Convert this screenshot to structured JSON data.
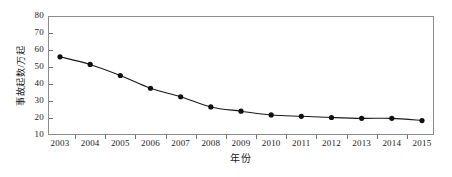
{
  "chart_data": {
    "type": "line",
    "title": "",
    "subtitle": "",
    "xlabel": "年份",
    "ylabel": "事故起数/万起",
    "categories": [
      "2003",
      "2004",
      "2005",
      "2006",
      "2007",
      "2008",
      "2009",
      "2010",
      "2011",
      "2012",
      "2013",
      "2014",
      "2015"
    ],
    "values": [
      56,
      51.5,
      45,
      37.5,
      32.5,
      26.5,
      24,
      21.8,
      21,
      20.3,
      19.8,
      19.8,
      18.5
    ],
    "series": [
      {
        "name": "事故起数",
        "values": [
          56,
          51.5,
          45,
          37.5,
          32.5,
          26.5,
          24,
          21.8,
          21,
          20.3,
          19.8,
          19.8,
          18.5
        ]
      }
    ],
    "xlim": [
      2003,
      2015
    ],
    "ylim": [
      10,
      80
    ],
    "ytick_labels": [
      "10",
      "20",
      "30",
      "40",
      "50",
      "60",
      "70",
      "80"
    ],
    "ytick_values": [
      10,
      20,
      30,
      40,
      50,
      60,
      70,
      80
    ],
    "xtick_labels": [
      "2003",
      "2004",
      "2005",
      "2006",
      "2007",
      "2008",
      "2009",
      "2010",
      "2011",
      "2012",
      "2013",
      "2014",
      "2015"
    ],
    "grid": false,
    "legend": null,
    "legend_position": "none",
    "marker": "filled-circle",
    "line_color": "#1a1a1a",
    "marker_color": "#101010",
    "frame_color": "#8c8c8c",
    "background_color": "#ffffff",
    "annotations": []
  }
}
